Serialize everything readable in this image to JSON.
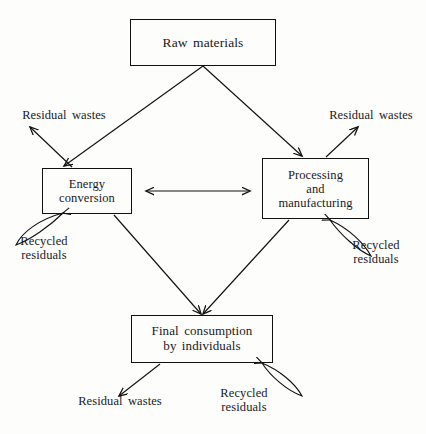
{
  "figure": {
    "background_color": "#fdfdfc",
    "line_color": "#111111"
  },
  "nodes": [
    {
      "id": "raw-materials",
      "label": "Raw materials"
    },
    {
      "id": "energy",
      "label": "Energy\nconversion"
    },
    {
      "id": "processing",
      "label": "Processing\nand\nmanufacturing"
    },
    {
      "id": "final",
      "label": "Final consumption\nby individuals"
    }
  ],
  "edge_labels": {
    "residual_wastes_left": "Residual wastes",
    "residual_wastes_right": "Residual wastes",
    "residual_wastes_bottom": "Residual wastes",
    "recycled_residuals_left": "Recycled\nresiduals",
    "recycled_residuals_right": "Recycled\nresiduals",
    "recycled_residuals_bottom": "Recycled\nresiduals"
  },
  "connections": [
    {
      "from": "raw-materials",
      "to": "energy",
      "type": "arrow"
    },
    {
      "from": "raw-materials",
      "to": "processing",
      "type": "arrow"
    },
    {
      "from": "energy",
      "to": "processing",
      "type": "double-arrow"
    },
    {
      "from": "energy",
      "to": "final",
      "type": "arrow"
    },
    {
      "from": "processing",
      "to": "final",
      "type": "arrow"
    },
    {
      "from": "energy",
      "to": "residual_wastes_left",
      "type": "arrow"
    },
    {
      "from": "processing",
      "to": "residual_wastes_right",
      "type": "arrow"
    },
    {
      "from": "final",
      "to": "residual_wastes_bottom",
      "type": "arrow"
    },
    {
      "from": "energy",
      "to": "recycled_residuals_left",
      "type": "loop"
    },
    {
      "from": "processing",
      "to": "recycled_residuals_right",
      "type": "loop"
    },
    {
      "from": "final",
      "to": "recycled_residuals_bottom",
      "type": "loop"
    }
  ]
}
